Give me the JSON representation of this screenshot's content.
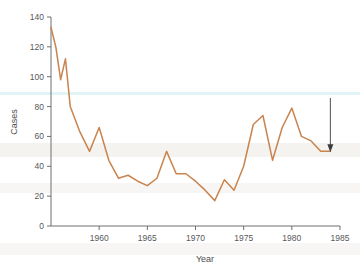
{
  "chart_data": {
    "type": "line",
    "title": "",
    "subtitle": "",
    "xlabel": "Year",
    "ylabel": "Cases",
    "xlim": [
      1955,
      1985
    ],
    "ylim": [
      0,
      140
    ],
    "xticks": [
      1960,
      1965,
      1970,
      1975,
      1980,
      1985
    ],
    "xtick_labels": [
      "1960",
      "1965",
      "1970",
      "1975",
      "1980",
      "1985"
    ],
    "yticks": [
      0,
      20,
      40,
      60,
      80,
      100,
      120,
      140
    ],
    "ytick_labels": [
      "0",
      "20",
      "40",
      "60",
      "80",
      "100",
      "120",
      "140"
    ],
    "grid": false,
    "legend": null,
    "line_color": "#c8834e",
    "x": [
      1955,
      1955.5,
      1956,
      1956.5,
      1957,
      1958,
      1959,
      1960,
      1961,
      1962,
      1963,
      1964,
      1965,
      1966,
      1967,
      1968,
      1969,
      1970,
      1971,
      1972,
      1973,
      1974,
      1975,
      1976,
      1977,
      1978,
      1979,
      1980,
      1981,
      1982,
      1983,
      1984
    ],
    "values": [
      133,
      120,
      98,
      112,
      80,
      63,
      50,
      66,
      44,
      32,
      34,
      30,
      27,
      32,
      50,
      35,
      35,
      30,
      24,
      17,
      31,
      24,
      40,
      68,
      74,
      44,
      66,
      79,
      60,
      57,
      50,
      50
    ],
    "series": [
      {
        "name": "Cases",
        "color": "#c8834e",
        "points": [
          {
            "year": 1955,
            "value": 133
          },
          {
            "year": 1955.5,
            "value": 120
          },
          {
            "year": 1956,
            "value": 98
          },
          {
            "year": 1956.5,
            "value": 112
          },
          {
            "year": 1957,
            "value": 80
          },
          {
            "year": 1958,
            "value": 63
          },
          {
            "year": 1959,
            "value": 50
          },
          {
            "year": 1960,
            "value": 66
          },
          {
            "year": 1961,
            "value": 44
          },
          {
            "year": 1962,
            "value": 32
          },
          {
            "year": 1963,
            "value": 34
          },
          {
            "year": 1964,
            "value": 30
          },
          {
            "year": 1965,
            "value": 27
          },
          {
            "year": 1966,
            "value": 32
          },
          {
            "year": 1967,
            "value": 50
          },
          {
            "year": 1968,
            "value": 35
          },
          {
            "year": 1969,
            "value": 35
          },
          {
            "year": 1970,
            "value": 30
          },
          {
            "year": 1971,
            "value": 24
          },
          {
            "year": 1972,
            "value": 17
          },
          {
            "year": 1973,
            "value": 31
          },
          {
            "year": 1974,
            "value": 24
          },
          {
            "year": 1975,
            "value": 40
          },
          {
            "year": 1976,
            "value": 68
          },
          {
            "year": 1977,
            "value": 74
          },
          {
            "year": 1978,
            "value": 44
          },
          {
            "year": 1979,
            "value": 66
          },
          {
            "year": 1980,
            "value": 79
          },
          {
            "year": 1981,
            "value": 60
          },
          {
            "year": 1982,
            "value": 57
          },
          {
            "year": 1983,
            "value": 50
          },
          {
            "year": 1984,
            "value": 50
          }
        ]
      }
    ],
    "annotations": [
      {
        "text": "37 cases ('84)",
        "target_year": 1984,
        "target_value": 50,
        "arrow": "down"
      }
    ]
  }
}
